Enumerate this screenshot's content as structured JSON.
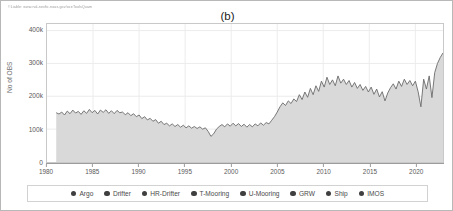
{
  "credit": {
    "text": "©Liable: www.nal-nexfic.noas.gov/oceToolsQuam"
  },
  "panel": {
    "title": "(b)"
  },
  "colors": {
    "area_fill": "#d9d9d9",
    "line": "#6b6b6b",
    "grid": "#ececec",
    "axis": "#9c9c9c",
    "legend_dot": "#3f3f3f",
    "text": "#5a5a5a"
  },
  "chart_data": {
    "type": "area",
    "title": "(b)",
    "xlabel": "",
    "ylabel": "No of OBS",
    "grid": true,
    "legend_position": "bottom",
    "xlim": [
      1980,
      2023
    ],
    "ylim": [
      0,
      420000
    ],
    "xtick_labels": [
      "1980",
      "1985",
      "1990",
      "1995",
      "2000",
      "2005",
      "2010",
      "2015",
      "2020"
    ],
    "xtick_values": [
      1980,
      1985,
      1990,
      1995,
      2000,
      2005,
      2010,
      2015,
      2020
    ],
    "ytick_labels": [
      "0",
      "100k",
      "200k",
      "300k",
      "400k"
    ],
    "ytick_values": [
      0,
      100000,
      200000,
      300000,
      400000
    ],
    "series": [
      {
        "name": "Total observations",
        "x": [
          1981.0,
          1981.3,
          1981.6,
          1981.9,
          1982.2,
          1982.5,
          1982.8,
          1983.1,
          1983.4,
          1983.7,
          1984.0,
          1984.3,
          1984.6,
          1984.9,
          1985.2,
          1985.5,
          1985.8,
          1986.1,
          1986.4,
          1986.7,
          1987.0,
          1987.3,
          1987.6,
          1987.9,
          1988.2,
          1988.5,
          1988.8,
          1989.1,
          1989.4,
          1989.7,
          1990.0,
          1990.3,
          1990.6,
          1990.9,
          1991.2,
          1991.5,
          1991.8,
          1992.1,
          1992.4,
          1992.7,
          1993.0,
          1993.3,
          1993.6,
          1993.9,
          1994.2,
          1994.5,
          1994.8,
          1995.1,
          1995.4,
          1995.7,
          1996.0,
          1996.3,
          1996.6,
          1996.9,
          1997.2,
          1997.5,
          1997.8,
          1998.1,
          1998.4,
          1998.7,
          1999.0,
          1999.3,
          1999.6,
          1999.9,
          2000.2,
          2000.5,
          2000.8,
          2001.1,
          2001.4,
          2001.7,
          2002.0,
          2002.3,
          2002.6,
          2002.9,
          2003.2,
          2003.5,
          2003.8,
          2004.1,
          2004.4,
          2004.7,
          2005.0,
          2005.3,
          2005.6,
          2005.9,
          2006.2,
          2006.5,
          2006.8,
          2007.1,
          2007.4,
          2007.7,
          2008.0,
          2008.3,
          2008.6,
          2008.9,
          2009.2,
          2009.5,
          2009.8,
          2010.1,
          2010.4,
          2010.7,
          2011.0,
          2011.3,
          2011.6,
          2011.9,
          2012.2,
          2012.5,
          2012.8,
          2013.1,
          2013.4,
          2013.7,
          2014.0,
          2014.3,
          2014.6,
          2014.9,
          2015.2,
          2015.5,
          2015.8,
          2016.1,
          2016.4,
          2016.7,
          2017.0,
          2017.3,
          2017.6,
          2017.9,
          2018.2,
          2018.5,
          2018.8,
          2019.1,
          2019.4,
          2019.7,
          2020.0,
          2020.3,
          2020.6,
          2020.9,
          2021.2,
          2021.5,
          2021.8,
          2022.1,
          2022.4,
          2022.7,
          2023.0
        ],
        "values": [
          150000,
          146000,
          152000,
          143000,
          155000,
          147000,
          158000,
          149000,
          154000,
          145000,
          156000,
          148000,
          160000,
          150000,
          157000,
          146000,
          158000,
          151000,
          159000,
          148000,
          156000,
          147000,
          157000,
          150000,
          152000,
          144000,
          150000,
          141000,
          147000,
          138000,
          143000,
          132000,
          138000,
          128000,
          133000,
          124000,
          129000,
          118000,
          124000,
          114000,
          118000,
          110000,
          116000,
          108000,
          114000,
          106000,
          112000,
          104000,
          110000,
          103000,
          108000,
          102000,
          107000,
          100000,
          104000,
          93000,
          78000,
          86000,
          100000,
          108000,
          114000,
          107000,
          116000,
          109000,
          118000,
          110000,
          117000,
          108000,
          115000,
          106000,
          114000,
          107000,
          116000,
          110000,
          119000,
          112000,
          120000,
          116000,
          127000,
          138000,
          152000,
          168000,
          180000,
          172000,
          186000,
          178000,
          192000,
          184000,
          205000,
          190000,
          213000,
          197000,
          224000,
          205000,
          232000,
          215000,
          246000,
          228000,
          258000,
          236000,
          250000,
          232000,
          262000,
          240000,
          252000,
          236000,
          248000,
          228000,
          242000,
          224000,
          236000,
          218000,
          230000,
          213000,
          228000,
          206000,
          222000,
          198000,
          214000,
          186000,
          210000,
          226000,
          238000,
          222000,
          246000,
          230000,
          252000,
          236000,
          248000,
          232000,
          246000,
          214000,
          168000,
          252000,
          222000,
          262000,
          196000,
          272000,
          300000,
          318000,
          332000
        ]
      }
    ]
  },
  "legend": {
    "items": [
      {
        "label": "Argo"
      },
      {
        "label": "Drifter"
      },
      {
        "label": "HR-Drifter"
      },
      {
        "label": "T-Mooring"
      },
      {
        "label": "U-Mooring"
      },
      {
        "label": "GRW"
      },
      {
        "label": "Ship"
      },
      {
        "label": "IMOS"
      }
    ]
  }
}
